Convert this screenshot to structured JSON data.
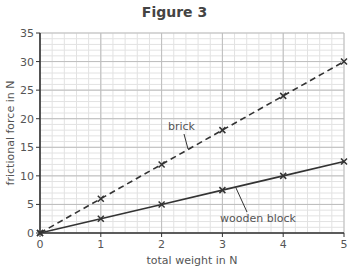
{
  "chart_data": {
    "type": "line",
    "title": "Figure 3",
    "xlabel": "total weight in N",
    "ylabel": "frictional force  in N",
    "xlim": [
      0,
      5
    ],
    "ylim": [
      0,
      35
    ],
    "xticks": [
      0,
      1,
      2,
      3,
      4,
      5
    ],
    "yticks": [
      0,
      5,
      10,
      15,
      20,
      25,
      30,
      35
    ],
    "grid": true,
    "minor_grid": {
      "x_step": 0.2,
      "y_step": 1
    },
    "series": [
      {
        "name": "brick",
        "style": "dashed",
        "marker": "x",
        "x": [
          0,
          1,
          2,
          3,
          4,
          5
        ],
        "values": [
          0,
          6,
          12,
          18,
          24,
          30
        ]
      },
      {
        "name": "wooden block",
        "style": "solid",
        "marker": "x",
        "x": [
          0,
          1,
          2,
          3,
          4,
          5
        ],
        "values": [
          0,
          2.5,
          5,
          7.5,
          10,
          12.5
        ]
      }
    ],
    "annotations": [
      {
        "text": "brick",
        "points_to": "brick"
      },
      {
        "text": "wooden block",
        "points_to": "wooden block"
      }
    ]
  },
  "colors": {
    "line": "#333333",
    "grid_minor": "#e2e2e2",
    "grid_major": "#bdbdbd",
    "text": "#555555"
  }
}
